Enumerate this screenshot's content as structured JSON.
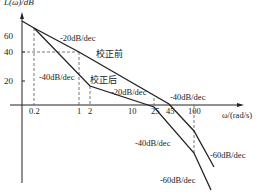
{
  "diagram": {
    "type": "bode-magnitude-asymptotic",
    "y_axis_label": "L(ω)/dB",
    "x_axis_label": "ω/(rad/s)",
    "y_ticks": [
      {
        "label": "60",
        "y": 36
      },
      {
        "label": "40",
        "y": 52
      },
      {
        "label": "20",
        "y": 81
      }
    ],
    "x_ticks": [
      {
        "label": "0.2",
        "x": 34
      },
      {
        "label": "1",
        "x": 79
      },
      {
        "label": "2",
        "x": 90
      },
      {
        "label": "10",
        "x": 133
      },
      {
        "label": "25",
        "x": 154
      },
      {
        "label": "45",
        "x": 170
      },
      {
        "label": "100",
        "x": 194
      }
    ],
    "curves": [
      {
        "name": "校正前",
        "segments": [
          {
            "slope": "-20dB/dec",
            "from_omega": 0.2,
            "to_omega": 45
          },
          {
            "slope": "-40dB/dec",
            "from_omega": 45,
            "to_omega": 100
          },
          {
            "slope": "-60dB/dec",
            "from_omega": 100
          }
        ],
        "reference_point": {
          "omega": 1,
          "db": 40
        }
      },
      {
        "name": "校正后",
        "segments": [
          {
            "slope": "-40dB/dec",
            "from_omega": 0.2,
            "to_omega": 2
          },
          {
            "slope": "-20dB/dec",
            "from_omega": 2,
            "to_omega": 25
          },
          {
            "slope": "-40dB/dec",
            "from_omega": 25,
            "to_omega": 100
          },
          {
            "slope": "-60dB/dec",
            "from_omega": 100
          }
        ]
      }
    ],
    "labels": {
      "pre_correction": "校正前",
      "post_correction": "校正后",
      "slope_m20_top": "-20dB/dec",
      "slope_m40_left": "-40dB/dec",
      "slope_m20_mid": "-20dB/dec",
      "slope_m40_right": "-40dB/dec",
      "slope_m40_lower": "-40dB/dec",
      "slope_m60_right": "-60dB/dec",
      "slope_m60_lower": "-60dB/dec"
    }
  }
}
